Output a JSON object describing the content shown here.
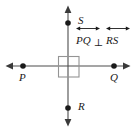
{
  "figure": {
    "canvas": {
      "width": 136,
      "height": 130,
      "background": "#ffffff"
    },
    "stroke_color": "#4d4d4d",
    "point_color": "#1a1a1a",
    "right_angle_color": "#8c8c8c",
    "points": [
      {
        "id": "P",
        "label": "P",
        "x": 23,
        "y": 66,
        "label_x": 19,
        "label_y": 72
      },
      {
        "id": "Q",
        "label": "Q",
        "x": 114,
        "y": 66,
        "label_x": 110,
        "label_y": 72
      },
      {
        "id": "S",
        "label": "S",
        "x": 68,
        "y": 23,
        "label_x": 78,
        "label_y": 15
      },
      {
        "id": "R",
        "label": "R",
        "x": 68,
        "y": 108,
        "label_x": 78,
        "label_y": 101
      }
    ],
    "lines": [
      {
        "id": "line-PQ",
        "orientation": "horizontal",
        "from": [
          6,
          66
        ],
        "to": [
          130,
          66
        ],
        "arrows": "both"
      },
      {
        "id": "line-RS",
        "orientation": "vertical",
        "from": [
          68,
          6
        ],
        "to": [
          68,
          126
        ],
        "arrows": "both"
      }
    ],
    "right_angle_marker": {
      "x": 58,
      "y": 56,
      "width": 21,
      "height": 21
    },
    "relation": {
      "left_term": "PQ",
      "symbol": "⊥",
      "symbol_name": "perpendicular",
      "right_term": "RS",
      "notation": "line",
      "full_text": "PQ ⊥ RS"
    }
  }
}
